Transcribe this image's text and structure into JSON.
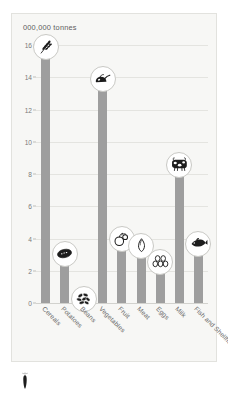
{
  "chart_data": {
    "type": "bar",
    "title": "000,000 tonnes",
    "xlabel": "",
    "ylabel": "",
    "ylim": [
      0,
      16
    ],
    "ytick_values": [
      0,
      2,
      4,
      6,
      8,
      10,
      12,
      14,
      16
    ],
    "grid": true,
    "legend": "none",
    "bar_color": "#9e9e9e",
    "background_color": "#f7f7f5",
    "categories": [
      "Cereals",
      "Potatoes",
      "Beans",
      "Vegetables",
      "Fruit",
      "Meat",
      "Eggs",
      "Milk",
      "Fish and Shellfish"
    ],
    "values": [
      15.8,
      3.0,
      0.2,
      13.8,
      3.9,
      3.5,
      2.5,
      8.5,
      3.6
    ],
    "icons": [
      "wheat-icon",
      "potato-icon",
      "beans-icon",
      "vegetables-icon",
      "fruit-icon",
      "meat-icon",
      "eggs-icon",
      "cow-icon",
      "fish-icon"
    ]
  },
  "marker": {
    "name": "arrow-marker"
  }
}
